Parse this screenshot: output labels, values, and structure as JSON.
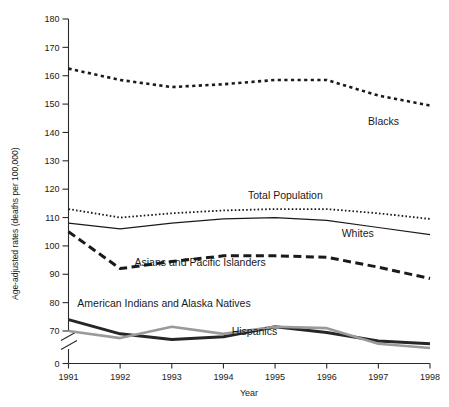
{
  "chart_data": {
    "type": "line",
    "title": "",
    "xlabel": "Year",
    "ylabel": "Age-adjusted rates (deaths per 100,000)",
    "x": [
      1991,
      1992,
      1993,
      1994,
      1995,
      1996,
      1997,
      1998
    ],
    "categories": [
      "1991",
      "1992",
      "1993",
      "1994",
      "1995",
      "1996",
      "1997",
      "1998"
    ],
    "xlim": [
      1991,
      1998
    ],
    "ylim": [
      70,
      180
    ],
    "y_axis_break": true,
    "y_break_from": 0,
    "y_break_to": 70,
    "ytick_labels": [
      "0",
      "70",
      "80",
      "90",
      "100",
      "110",
      "120",
      "130",
      "140",
      "150",
      "160",
      "170",
      "180"
    ],
    "yticks": [
      0,
      70,
      80,
      90,
      100,
      110,
      120,
      130,
      140,
      150,
      160,
      170,
      180
    ],
    "grid": false,
    "legend": "inline-labels",
    "series": [
      {
        "name": "Blacks",
        "label": "Blacks",
        "style": "dotted-thick",
        "color": "#1a1a1a",
        "label_x": 1997.1,
        "label_y": 142.5,
        "values": [
          162.5,
          158.5,
          156.0,
          157.0,
          158.5,
          158.5,
          153.0,
          149.5
        ]
      },
      {
        "name": "Total Population",
        "label": "Total Population",
        "style": "dotted-fine",
        "color": "#1a1a1a",
        "label_x": 1995.2,
        "label_y": 116.5,
        "values": [
          113.0,
          110.0,
          111.5,
          112.5,
          113.0,
          113.0,
          111.5,
          109.5
        ]
      },
      {
        "name": "Whites",
        "label": "Whites",
        "style": "solid-thin",
        "color": "#1a1a1a",
        "label_x": 1996.6,
        "label_y": 103.0,
        "values": [
          108.0,
          106.0,
          108.0,
          109.5,
          110.0,
          109.0,
          106.5,
          104.0
        ]
      },
      {
        "name": "Asians and Pacific Islanders",
        "label": "Asians and Pacific Islanders",
        "style": "dashed-thick",
        "color": "#1a1a1a",
        "label_x": 1993.55,
        "label_y": 93.0,
        "values": [
          105.0,
          92.0,
          94.5,
          96.5,
          96.5,
          96.0,
          92.5,
          88.5
        ]
      },
      {
        "name": "American Indians and Alaska Natives",
        "label": "American Indians and Alaska Natives",
        "style": "solid-thick",
        "color": "#262626",
        "label_x": 1992.85,
        "label_y": 78.5,
        "values": [
          74.0,
          69.0,
          67.0,
          68.0,
          71.5,
          69.5,
          66.5,
          65.5
        ]
      },
      {
        "name": "Hispanics",
        "label": "Hispanics",
        "style": "solid-thick-gray",
        "color": "#9a9a9a",
        "label_x": 1994.6,
        "label_y": 68.5,
        "values": [
          70.0,
          67.5,
          71.5,
          69.0,
          71.5,
          71.0,
          65.5,
          64.0
        ]
      }
    ]
  },
  "axis": {
    "y_title": "Age-adjusted rates (deaths per 100,000)",
    "x_title": "Year"
  }
}
